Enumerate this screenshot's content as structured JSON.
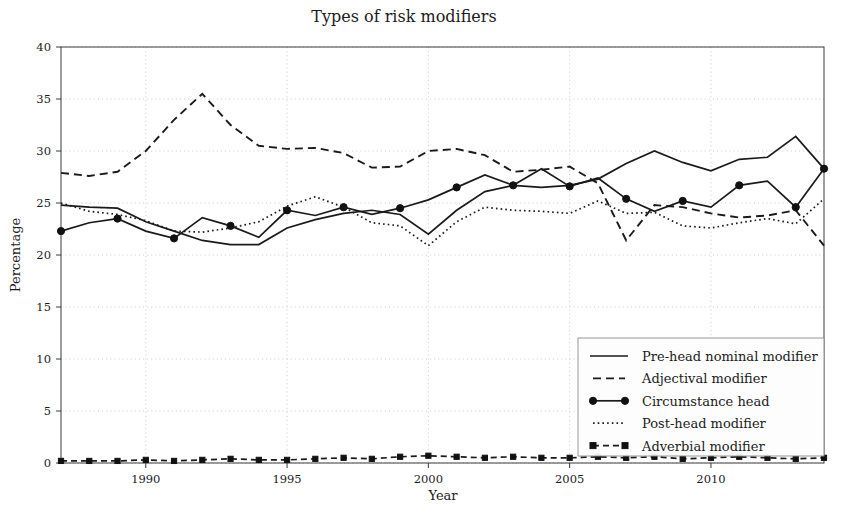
{
  "chart_data": {
    "type": "line",
    "title": "Types of risk modifiers",
    "xlabel": "Year",
    "ylabel": "Percentage",
    "xlim": [
      1987,
      2014
    ],
    "ylim": [
      0,
      40
    ],
    "ytick_values": [
      0,
      5,
      10,
      15,
      20,
      25,
      30,
      35,
      40
    ],
    "ytick_labels": [
      "0",
      "5",
      "10",
      "15",
      "20",
      "25",
      "30",
      "35",
      "40"
    ],
    "xtick_values": [
      1990,
      1995,
      2000,
      2005,
      2010
    ],
    "xtick_labels": [
      "1990",
      "1995",
      "2000",
      "2005",
      "2010"
    ],
    "grid": true,
    "legend_position": "lower-right",
    "x": [
      1987,
      1988,
      1989,
      1990,
      1991,
      1992,
      1993,
      1994,
      1995,
      1996,
      1997,
      1998,
      1999,
      2000,
      2001,
      2002,
      2003,
      2004,
      2005,
      2006,
      2007,
      2008,
      2009,
      2010,
      2011,
      2012,
      2013,
      2014
    ],
    "series": [
      {
        "name": "Pre-head nominal modifier",
        "style": "solid",
        "marker": "none",
        "values": [
          24.8,
          24.6,
          24.5,
          23.2,
          22.3,
          21.4,
          21.0,
          21.0,
          22.6,
          23.4,
          24.0,
          24.3,
          23.9,
          22.0,
          24.3,
          26.1,
          26.7,
          26.5,
          26.7,
          27.3,
          28.8,
          30.0,
          28.9,
          28.1,
          29.2,
          29.4,
          31.4,
          28.3
        ]
      },
      {
        "name": "Adjectival modifier",
        "style": "dashed",
        "marker": "none",
        "values": [
          27.9,
          27.6,
          28.0,
          30.0,
          33.0,
          35.5,
          32.5,
          30.5,
          30.2,
          30.3,
          29.8,
          28.4,
          28.5,
          30.0,
          30.2,
          29.6,
          28.0,
          28.2,
          28.5,
          26.9,
          21.4,
          24.8,
          24.6,
          24.0,
          23.6,
          23.8,
          24.3,
          20.9
        ]
      },
      {
        "name": "Circumstance head",
        "style": "solid",
        "marker": "circle",
        "values": [
          22.3,
          23.1,
          23.5,
          22.3,
          21.6,
          23.6,
          22.8,
          21.7,
          24.3,
          23.8,
          24.6,
          23.9,
          24.5,
          25.3,
          26.5,
          27.7,
          26.7,
          28.3,
          26.6,
          27.4,
          25.4,
          24.2,
          25.2,
          24.6,
          26.7,
          27.1,
          24.6,
          28.3
        ]
      },
      {
        "name": "Post-head modifier",
        "style": "dotted",
        "marker": "none",
        "values": [
          25.0,
          24.2,
          23.9,
          23.3,
          22.3,
          22.2,
          22.6,
          23.2,
          24.7,
          25.6,
          24.6,
          23.1,
          22.8,
          20.9,
          23.2,
          24.6,
          24.3,
          24.2,
          24.0,
          25.2,
          24.0,
          24.1,
          22.8,
          22.6,
          23.1,
          23.5,
          23.0,
          25.4
        ]
      },
      {
        "name": "Adverbial modifier",
        "style": "dashed-marker",
        "marker": "square",
        "values": [
          0.2,
          0.2,
          0.2,
          0.3,
          0.2,
          0.3,
          0.4,
          0.3,
          0.3,
          0.4,
          0.5,
          0.4,
          0.6,
          0.7,
          0.6,
          0.5,
          0.6,
          0.5,
          0.5,
          0.6,
          0.5,
          0.6,
          0.4,
          0.5,
          0.6,
          0.5,
          0.4,
          0.5
        ]
      }
    ]
  },
  "legend": {
    "items": [
      {
        "label": "Pre-head nominal modifier",
        "key": "solid"
      },
      {
        "label": "Adjectival modifier",
        "key": "dashed"
      },
      {
        "label": "Circumstance head",
        "key": "circle"
      },
      {
        "label": "Post-head modifier",
        "key": "dotted"
      },
      {
        "label": "Adverbial modifier",
        "key": "square"
      }
    ]
  }
}
